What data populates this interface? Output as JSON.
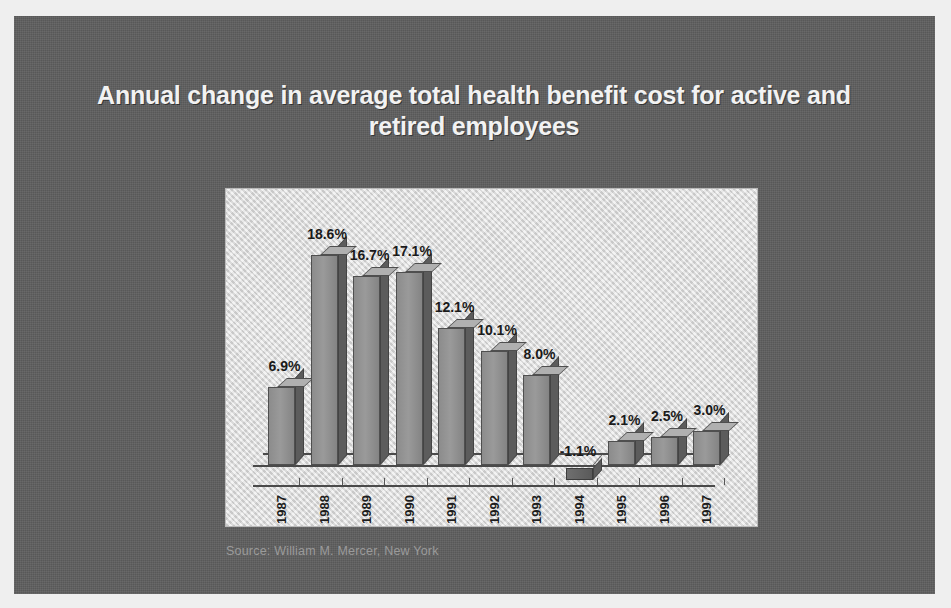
{
  "slide": {
    "title": "Annual change in average total health benefit cost for active and retired employees",
    "source": "Source:  William M. Mercer, New York",
    "panel_color": "#5e5e5e",
    "chart_bg_color": "#dcdcdc",
    "title_color": "#f2f2f2"
  },
  "chart_data": {
    "type": "bar",
    "title": "Annual change in average total health benefit cost for active and retired employees",
    "xlabel": "",
    "ylabel": "",
    "ylim": [
      -2,
      20
    ],
    "grid": false,
    "legend": "none",
    "categories": [
      "1987",
      "1988",
      "1989",
      "1990",
      "1991",
      "1992",
      "1993",
      "1994",
      "1995",
      "1996",
      "1997"
    ],
    "values": [
      6.9,
      18.6,
      16.7,
      17.1,
      12.1,
      10.1,
      8.0,
      -1.1,
      2.1,
      2.5,
      3.0
    ],
    "data_labels": [
      "6.9%",
      "18.6%",
      "16.7%",
      "17.1%",
      "12.1%",
      "10.1%",
      "8.0%",
      "-1.1%",
      "2.1%",
      "2.5%",
      "3.0%"
    ],
    "unit": "%",
    "bar_style": "3d",
    "bar_color": "#8c8c8c",
    "source": "Source:  William M. Mercer, New York"
  }
}
